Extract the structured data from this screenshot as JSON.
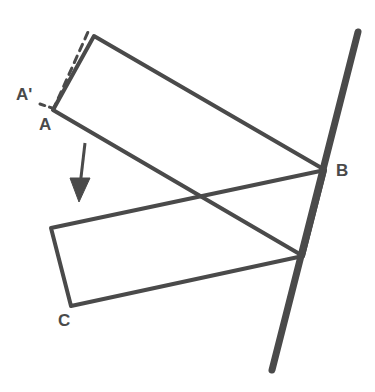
{
  "figure": {
    "background_color": "#ffffff",
    "stroke_color": "#4a4a4a",
    "thick_stroke_color": "#4a4a4a",
    "labels": {
      "a_prime": "A'",
      "a": "A",
      "b": "B",
      "c": "C"
    },
    "label_color": "#4a4a4a",
    "shapes": {
      "upper_rectangle": {
        "name": "rotated-rectangle-AB",
        "points": "53,110 94,36 325,170 303,256",
        "stroke_width": 4
      },
      "lower_rectangle": {
        "name": "translated-rectangle-C",
        "points": "51,228 303,256 325,170 71,306",
        "stroke_width": 4
      },
      "upper_polygon_points": "53,110 94,36 325,170 303,256",
      "lower_polygon_points": "51,228 71,306 303,256 325,170",
      "dashed_edge": {
        "name": "dashed-original-edge",
        "x1": 53,
        "y1": 110,
        "x2": 88,
        "y2": 32,
        "dash": "7 6",
        "stroke_width": 3
      },
      "dashed_tick": {
        "name": "dashed-angle-tick",
        "x1": 40,
        "y1": 104,
        "x2": 55,
        "y2": 109,
        "dash": "5 5",
        "stroke_width": 3
      },
      "mirror_line": {
        "name": "mirror-line",
        "x1": 358,
        "y1": 32,
        "x2": 272,
        "y2": 370,
        "stroke_width": 7
      },
      "arrow": {
        "name": "translation-arrow",
        "shaft_x1": 85,
        "shaft_y1": 143,
        "shaft_x2": 80,
        "shaft_y2": 186,
        "head_points": "79,202 70,178 90,178",
        "stroke_width": 3
      }
    }
  },
  "chart_data": {
    "type": "diagram",
    "annotations": [
      "A'",
      "A",
      "B",
      "C"
    ],
    "elements": [
      {
        "name": "upper rectangle",
        "type": "quadrilateral",
        "vertices": [
          [
            53,
            110
          ],
          [
            94,
            36
          ],
          [
            325,
            170
          ],
          [
            303,
            256
          ]
        ]
      },
      {
        "name": "lower rectangle",
        "type": "quadrilateral",
        "vertices": [
          [
            51,
            228
          ],
          [
            71,
            306
          ],
          [
            303,
            256
          ],
          [
            325,
            170
          ]
        ]
      },
      {
        "name": "mirror line",
        "type": "segment",
        "from": [
          358,
          32
        ],
        "to": [
          272,
          370
        ]
      },
      {
        "name": "translation arrow",
        "type": "arrow",
        "from": [
          85,
          143
        ],
        "to": [
          79,
          202
        ]
      },
      {
        "name": "dashed edge",
        "type": "dashed-segment",
        "from": [
          53,
          110
        ],
        "to": [
          88,
          32
        ]
      }
    ]
  }
}
